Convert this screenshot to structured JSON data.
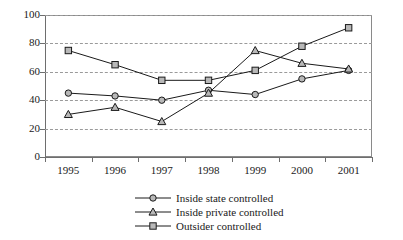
{
  "chart_data": {
    "type": "line",
    "title": "",
    "xlabel": "",
    "ylabel": "",
    "categories": [
      "1995",
      "1996",
      "1997",
      "1998",
      "1999",
      "2000",
      "2001"
    ],
    "ylim": [
      0,
      100
    ],
    "yticks": [
      0,
      20,
      40,
      60,
      80,
      100
    ],
    "grid": true,
    "legend_position": "bottom",
    "series": [
      {
        "name": "Inside state controlled",
        "marker": "circle",
        "values": [
          45,
          43,
          40,
          47,
          44,
          55,
          61
        ]
      },
      {
        "name": "Inside private controlled",
        "marker": "triangle",
        "values": [
          30,
          35,
          25,
          45,
          75,
          66,
          62
        ]
      },
      {
        "name": "Outsider controlled",
        "marker": "square",
        "values": [
          75,
          65,
          54,
          54,
          61,
          78,
          91
        ]
      }
    ]
  },
  "axis": {
    "y_tick_labels": [
      "0",
      "20",
      "40",
      "60",
      "80",
      "100"
    ],
    "x_tick_labels": [
      "1995",
      "1996",
      "1997",
      "1998",
      "1999",
      "2000",
      "2001"
    ]
  },
  "legend": {
    "items": [
      {
        "label": "Inside state controlled",
        "marker": "circle-marker-icon"
      },
      {
        "label": "Inside private controlled",
        "marker": "triangle-marker-icon"
      },
      {
        "label": "Outsider controlled",
        "marker": "square-marker-icon"
      }
    ]
  },
  "colors": {
    "line": "#1a1a1a",
    "marker_fill": "#b8b8b8",
    "grid": "#9a9a9a",
    "axis": "#6e6e6e",
    "background": "#ffffff"
  }
}
